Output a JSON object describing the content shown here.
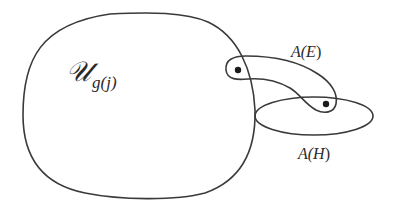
{
  "diagram": {
    "type": "set-diagram",
    "sets": [
      {
        "id": "U",
        "label_main": "𝒰",
        "label_sub": "g(j)",
        "shape": "rounded-blob"
      },
      {
        "id": "AE",
        "label_prefix": "A(",
        "label_var": "E",
        "label_suffix": ")",
        "shape": "curved-capsule",
        "points": 2
      },
      {
        "id": "AH",
        "label_prefix": "A(",
        "label_var": "H",
        "label_suffix": ")",
        "shape": "ellipse"
      }
    ],
    "points": [
      {
        "id": "p1",
        "x": 238,
        "y": 70,
        "inside": [
          "U",
          "AE"
        ]
      },
      {
        "id": "p2",
        "x": 326,
        "y": 104,
        "inside": [
          "AE",
          "AH"
        ]
      }
    ],
    "colors": {
      "stroke": "#3a3a3a",
      "dot": "#1a1a1a",
      "background": "#ffffff"
    }
  }
}
